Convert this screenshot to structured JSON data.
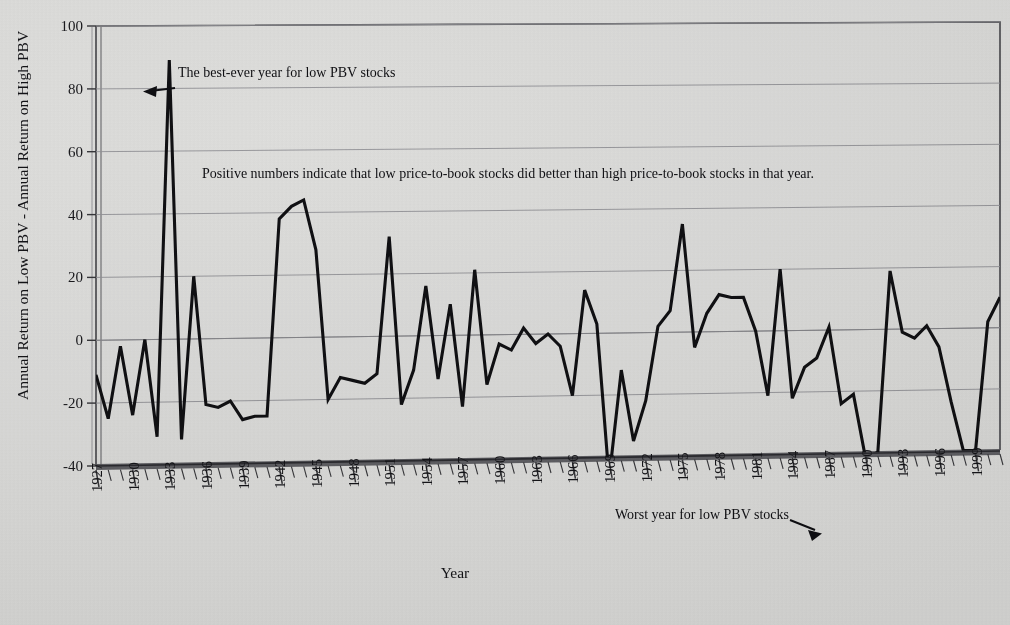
{
  "figure": {
    "ylabel": "Annual Return on Low PBV - Annual Return on High PBV",
    "xlabel": "Year",
    "note": "Positive numbers indicate that low price-to-book stocks did better than high price-to-book stocks in that year.",
    "annotation_best": "The best-ever year for low PBV stocks",
    "annotation_worst": "Worst year for low PBV stocks",
    "line_color": "#111114",
    "plot_bg": "#ebebea",
    "grid_color": "#8d8d92",
    "axis_color": "#3a3a3e"
  },
  "yticks": [
    "-40",
    "-20",
    "0",
    "20",
    "40",
    "60",
    "80",
    "100"
  ],
  "xticks": [
    "1927",
    "1930",
    "1933",
    "1936",
    "1939",
    "1942",
    "1945",
    "1948",
    "1951",
    "1954",
    "1957",
    "1960",
    "1963",
    "1966",
    "1969",
    "1972",
    "1975",
    "1978",
    "1981",
    "1984",
    "1987",
    "1990",
    "1993",
    "1996",
    "1999"
  ],
  "chart_data": {
    "type": "line",
    "title": "",
    "xlabel": "Year",
    "ylabel": "Annual Return on Low PBV - Annual Return on High PBV",
    "ylim": [
      -40,
      100
    ],
    "xlim": [
      1927,
      2001
    ],
    "grid": true,
    "legend": "none",
    "annotations": [
      {
        "text": "The best-ever year for low PBV stocks",
        "points_to_year": 1933,
        "points_to_value": 89
      },
      {
        "text": "Worst year for low PBV stocks",
        "points_to_year": 1990,
        "points_to_value": -42
      },
      {
        "text": "Positive numbers indicate that low price-to-book stocks did better than high price-to-book stocks in that year.",
        "points_to_year": null,
        "points_to_value": null
      }
    ],
    "series": [
      {
        "name": "Low PBV minus High PBV annual return",
        "x": [
          1927,
          1928,
          1929,
          1930,
          1931,
          1932,
          1933,
          1934,
          1935,
          1936,
          1937,
          1938,
          1939,
          1940,
          1941,
          1942,
          1943,
          1944,
          1945,
          1946,
          1947,
          1948,
          1949,
          1950,
          1951,
          1952,
          1953,
          1954,
          1955,
          1956,
          1957,
          1958,
          1959,
          1960,
          1961,
          1962,
          1963,
          1964,
          1965,
          1966,
          1967,
          1968,
          1969,
          1970,
          1971,
          1972,
          1973,
          1974,
          1975,
          1976,
          1977,
          1978,
          1979,
          1980,
          1981,
          1982,
          1983,
          1984,
          1985,
          1986,
          1987,
          1988,
          1989,
          1990,
          1991,
          1992,
          1993,
          1994,
          1995,
          1996,
          1997,
          1998,
          1999,
          2000,
          2001
        ],
        "y": [
          -11,
          -25,
          -2,
          -24,
          0,
          -31,
          89,
          -32,
          20,
          -21,
          -22,
          -20,
          -26,
          -25,
          -25,
          38,
          42,
          44,
          28,
          -20,
          -13,
          -14,
          -15,
          -12,
          32,
          -22,
          -11,
          16,
          -14,
          10,
          -23,
          21,
          -16,
          -3,
          -5,
          2,
          -3,
          0,
          -4,
          -20,
          14,
          3,
          -47,
          -12,
          -35,
          -22,
          2,
          7,
          35,
          -5,
          6,
          12,
          11,
          11,
          0,
          -21,
          20,
          -22,
          -12,
          -9,
          1,
          -24,
          -21,
          -42,
          -40,
          19,
          -1,
          -3,
          1,
          -6,
          -24,
          -40,
          -40,
          2,
          10
        ]
      }
    ]
  }
}
